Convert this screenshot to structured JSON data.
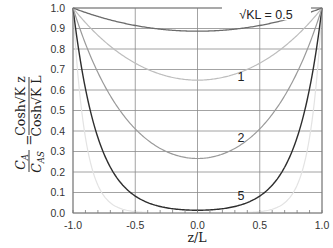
{
  "chart_data": {
    "type": "line",
    "title": "",
    "xlabel": "z/L",
    "ylabel": "C_A / C_AS = Cosh√K z / Cosh√K L",
    "ylabel_parts": {
      "lhs_num": "C",
      "lhs_num_sub": "A",
      "lhs_den": "C",
      "lhs_den_sub": "AS",
      "equals": "=",
      "rhs_num": "Cosh√K z",
      "rhs_den": "Cosh√K L"
    },
    "xlim": [
      -1.0,
      1.0
    ],
    "ylim": [
      0.0,
      1.0
    ],
    "x_ticks": [
      "-1.0",
      "-0.5",
      "0.0",
      "0.5",
      "1.0"
    ],
    "y_ticks": [
      "0.0",
      "0.1",
      "0.2",
      "0.3",
      "0.4",
      "0.5",
      "0.6",
      "0.7",
      "0.8",
      "0.9",
      "1.0"
    ],
    "grid": true,
    "legend": "inline labels",
    "series": [
      {
        "name": "√KL = 0.5",
        "param": 0.5,
        "label": "√KL = 0.5",
        "color": "#6b6b6b",
        "width": 1.3,
        "x": [
          -1.0,
          -0.75,
          -0.5,
          -0.25,
          0.0,
          0.25,
          0.5,
          0.75,
          1.0
        ],
        "y": [
          1.0,
          0.947,
          0.912,
          0.893,
          0.887,
          0.893,
          0.912,
          0.947,
          1.0
        ]
      },
      {
        "name": "1",
        "param": 1,
        "label": "1",
        "color": "#bdbdbd",
        "width": 1.2,
        "x": [
          -1.0,
          -0.75,
          -0.5,
          -0.25,
          0.0,
          0.25,
          0.5,
          0.75,
          1.0
        ],
        "y": [
          1.0,
          0.843,
          0.732,
          0.668,
          0.648,
          0.668,
          0.732,
          0.843,
          1.0
        ]
      },
      {
        "name": "2",
        "param": 2,
        "label": "2",
        "color": "#9a9a9a",
        "width": 1.2,
        "x": [
          -1.0,
          -0.75,
          -0.5,
          -0.25,
          0.0,
          0.25,
          0.5,
          0.75,
          1.0
        ],
        "y": [
          1.0,
          0.627,
          0.41,
          0.302,
          0.266,
          0.302,
          0.41,
          0.627,
          1.0
        ]
      },
      {
        "name": "5",
        "param": 5,
        "label": "5",
        "color": "#2e2e2e",
        "width": 1.4,
        "x": [
          -1.0,
          -0.75,
          -0.5,
          -0.25,
          0.0,
          0.25,
          0.5,
          0.75,
          1.0
        ],
        "y": [
          1.0,
          0.287,
          0.083,
          0.026,
          0.013,
          0.026,
          0.083,
          0.287,
          1.0
        ]
      },
      {
        "name": "10",
        "param": 10,
        "label": "",
        "color": "#e3e3e3",
        "width": 1.2,
        "x": [
          -1.0,
          -0.75,
          -0.5,
          -0.25,
          0.0,
          0.25,
          0.5,
          0.75,
          1.0
        ],
        "y": [
          1.0,
          0.082,
          0.007,
          0.001,
          0.0001,
          0.001,
          0.007,
          0.082,
          1.0
        ]
      }
    ],
    "annotations": [
      {
        "text": "√KL = 0.5",
        "x": 0.55,
        "y": 0.96
      },
      {
        "text": "1",
        "x": 0.35,
        "y": 0.66
      },
      {
        "text": "2",
        "x": 0.35,
        "y": 0.36
      },
      {
        "text": "5",
        "x": 0.35,
        "y": 0.08
      }
    ]
  }
}
